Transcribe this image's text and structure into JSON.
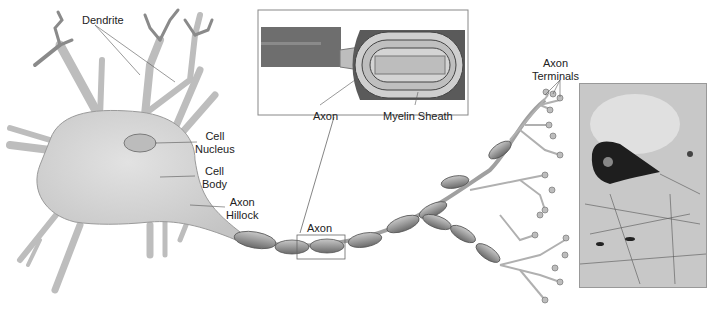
{
  "diagram": {
    "labels": {
      "dendrite": "Dendrite",
      "cell_nucleus_1": "Cell",
      "cell_nucleus_2": "Nucleus",
      "cell_body_1": "Cell",
      "cell_body_2": "Body",
      "axon_hillock_1": "Axon",
      "axon_hillock_2": "Hillock",
      "axon": "Axon",
      "axon_terminals_1": "Axon",
      "axon_terminals_2": "Terminals",
      "inset_axon": "Axon",
      "inset_myelin": "Myelin Sheath"
    },
    "colors": {
      "cell_fill": "#d6d6d6",
      "cell_stroke": "#8a8a8a",
      "myelin_fill": "#a9a9a9",
      "inset_dark": "#6e6e6e",
      "line": "#555555"
    },
    "micrograph_caption": ""
  }
}
